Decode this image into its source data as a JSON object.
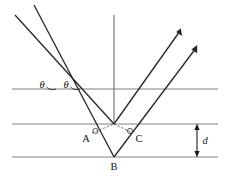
{
  "figure": {
    "name": "bragg-diffraction-diagram",
    "type": "physics-ray-diagram",
    "background_color": "#ffffff",
    "width": 226,
    "height": 182
  },
  "labels": {
    "theta_left": "θ",
    "theta_right": "θ",
    "point_a": "A",
    "point_b": "B",
    "point_c": "C",
    "spacing": "d"
  },
  "colors": {
    "plane_line": "#808080",
    "ray_line": "#262626",
    "dashed_path": "#555555",
    "dimension": "#1a1a1a",
    "text": "#111111"
  },
  "geometry": {
    "planes": [
      {
        "name": "plane-top",
        "x1": 12,
        "y1": 89,
        "x2": 218,
        "y2": 89
      },
      {
        "name": "plane-middle",
        "x1": 12,
        "y1": 124,
        "x2": 218,
        "y2": 124
      },
      {
        "name": "plane-bottom",
        "x1": 12,
        "y1": 157,
        "x2": 218,
        "y2": 157
      }
    ],
    "normal": {
      "x1": 114,
      "y1": 15,
      "x2": 114,
      "y2": 124
    },
    "incident_rays": [
      {
        "name": "incident-ray-1",
        "x1": 15,
        "y1": 15,
        "x2": 114,
        "y2": 124
      },
      {
        "name": "incident-ray-2",
        "x1": 34,
        "y1": 5,
        "x2": 114,
        "y2": 157
      }
    ],
    "reflected_rays": [
      {
        "name": "reflected-ray-1",
        "x1": 114,
        "y1": 124,
        "x2": 180,
        "y2": 30
      },
      {
        "name": "reflected-ray-2",
        "x1": 114,
        "y1": 157,
        "x2": 196,
        "y2": 47
      }
    ],
    "dashed_segments": [
      {
        "name": "dashed-a-to-vertex",
        "x1": 92,
        "y1": 133,
        "x2": 114,
        "y2": 124
      },
      {
        "name": "dashed-vertex-to-c",
        "x1": 114,
        "y1": 124,
        "x2": 133,
        "y2": 133
      }
    ],
    "dimension_arrow": {
      "x": 197,
      "y_top": 124,
      "y_bottom": 157
    },
    "label_positions": {
      "theta_left": {
        "x": 46,
        "y": 88
      },
      "theta_right": {
        "x": 70,
        "y": 88
      },
      "point_a": {
        "x": 84,
        "y": 142
      },
      "point_b": {
        "x": 111,
        "y": 170
      },
      "point_c": {
        "x": 136,
        "y": 142
      },
      "spacing": {
        "x": 203,
        "y": 144
      }
    }
  }
}
